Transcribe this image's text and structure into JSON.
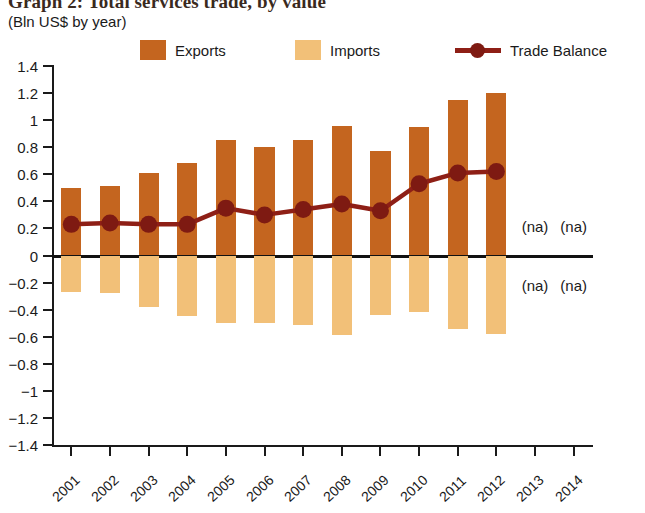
{
  "title": "Graph 2: Total services trade, by value",
  "subtitle": "(Bln US$ by year)",
  "legend": [
    {
      "key": "exports",
      "label": "Exports",
      "type": "swatch",
      "color": "#c4651f"
    },
    {
      "key": "imports",
      "label": "Imports",
      "type": "swatch",
      "color": "#f2c078"
    },
    {
      "key": "balance",
      "label": "Trade Balance",
      "type": "line",
      "color": "#8e1f16"
    }
  ],
  "na_markers": [
    {
      "label": "(na)",
      "year": "2013",
      "position": "above-axis"
    },
    {
      "label": "(na)",
      "year": "2014",
      "position": "above-axis"
    },
    {
      "label": "(na)",
      "year": "2013",
      "position": "below-axis"
    },
    {
      "label": "(na)",
      "year": "2014",
      "position": "below-axis"
    }
  ],
  "colors": {
    "exports": "#c4651f",
    "imports": "#f2c078",
    "balance_line": "#8e1f16",
    "balance_marker": "#7e1a12",
    "axis": "#1a1a1a",
    "zero_line": "#111111",
    "background": "#ffffff",
    "title_text": "#3a2a1e"
  },
  "chart_data": {
    "type": "bar",
    "title": "Graph 2: Total services trade, by value",
    "subtitle": "(Bln US$ by year)",
    "xlabel": "",
    "ylabel": "",
    "ylim": [
      -1.4,
      1.4
    ],
    "yticks": [
      1.4,
      1.2,
      1,
      0.8,
      0.6,
      0.4,
      0.2,
      0,
      -0.2,
      -0.4,
      -0.6,
      -0.8,
      -1,
      -1.2,
      -1.4
    ],
    "ytick_labels": [
      "1.4",
      "1.2",
      "1",
      "0.8",
      "0.6",
      "0.4",
      "0.2",
      "0",
      "−0.2",
      "−0.4",
      "−0.6",
      "−0.8",
      "−1",
      "−1.2",
      "−1.4"
    ],
    "categories": [
      "2001",
      "2002",
      "2003",
      "2004",
      "2005",
      "2006",
      "2007",
      "2008",
      "2009",
      "2010",
      "2011",
      "2012",
      "2013",
      "2014"
    ],
    "grid": false,
    "legend_position": "top",
    "series": [
      {
        "name": "Exports",
        "type": "bar",
        "color": "#c4651f",
        "values": [
          0.5,
          0.51,
          0.61,
          0.68,
          0.85,
          0.8,
          0.85,
          0.96,
          0.77,
          0.95,
          1.15,
          1.2,
          null,
          null
        ]
      },
      {
        "name": "Imports",
        "type": "bar",
        "color": "#f2c078",
        "values": [
          -0.27,
          -0.28,
          -0.38,
          -0.45,
          -0.5,
          -0.5,
          -0.51,
          -0.59,
          -0.44,
          -0.42,
          -0.54,
          -0.58,
          null,
          null
        ]
      },
      {
        "name": "Trade Balance",
        "type": "line",
        "color": "#8e1f16",
        "values": [
          0.23,
          0.24,
          0.23,
          0.23,
          0.35,
          0.3,
          0.34,
          0.38,
          0.33,
          0.53,
          0.61,
          0.62,
          null,
          null
        ]
      }
    ]
  }
}
